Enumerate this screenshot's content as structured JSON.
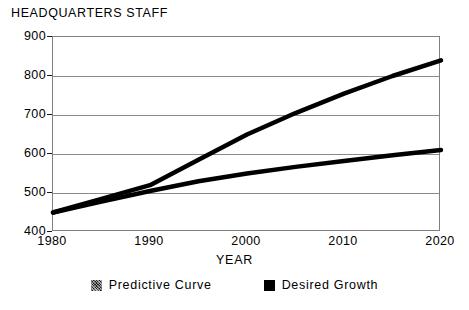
{
  "chart_data": {
    "type": "line",
    "title": "HEADQUARTERS STAFF",
    "xlabel": "YEAR",
    "ylabel": "",
    "grid": true,
    "legend_position": "bottom",
    "x": [
      1980,
      1985,
      1990,
      1995,
      2000,
      2005,
      2010,
      2015,
      2020
    ],
    "xlim": [
      1980,
      2020
    ],
    "ylim": [
      400,
      900
    ],
    "xticks": [
      1980,
      1990,
      2000,
      2010,
      2020
    ],
    "yticks": [
      400,
      500,
      600,
      700,
      800,
      900
    ],
    "xtick_labels": [
      "1980",
      "1990",
      "2000",
      "2010",
      "2020"
    ],
    "ytick_labels": [
      "400",
      "500",
      "600",
      "700",
      "800",
      "900"
    ],
    "series": [
      {
        "name": "Predictive Curve",
        "swatch": "dither",
        "values": [
          450,
          485,
          520,
          585,
          650,
          705,
          755,
          800,
          840
        ]
      },
      {
        "name": "Desired Growth",
        "swatch": "solid",
        "values": [
          450,
          478,
          505,
          530,
          550,
          567,
          582,
          597,
          610
        ]
      }
    ]
  },
  "legend": {
    "items": [
      {
        "label": "Predictive Curve"
      },
      {
        "label": "Desired Growth"
      }
    ]
  },
  "colors": {
    "series_line": "#000000",
    "gridline": "#8a8a8a",
    "axis": "#808080",
    "text": "#000000",
    "background": "#ffffff"
  }
}
